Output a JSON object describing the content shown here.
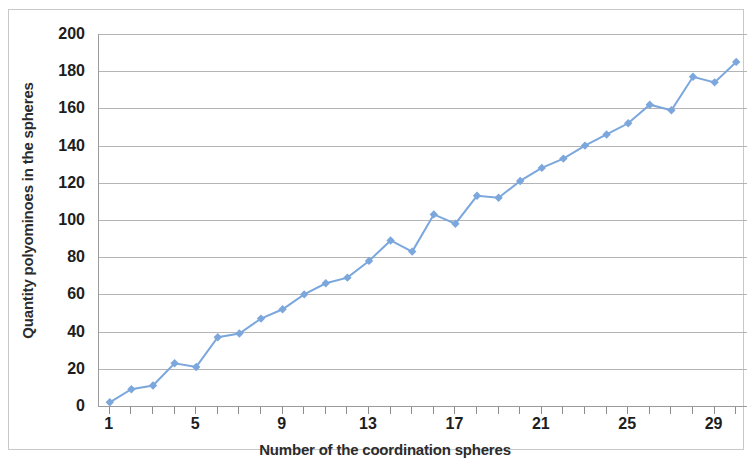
{
  "chart_data": {
    "type": "line",
    "title": "",
    "subtitle": "",
    "xlabel": "Number of the coordination spheres",
    "ylabel": "Quantity polyominoes in the spheres",
    "xlim": [
      0.5,
      30.5
    ],
    "ylim": [
      0,
      200
    ],
    "x_tick_labels": [
      "1",
      "5",
      "9",
      "13",
      "17",
      "21",
      "25",
      "29"
    ],
    "x_tick_values": [
      1,
      5,
      9,
      13,
      17,
      21,
      25,
      29
    ],
    "x_minor_ticks": [
      1,
      2,
      3,
      4,
      5,
      6,
      7,
      8,
      9,
      10,
      11,
      12,
      13,
      14,
      15,
      16,
      17,
      18,
      19,
      20,
      21,
      22,
      23,
      24,
      25,
      26,
      27,
      28,
      29,
      30
    ],
    "y_tick_labels": [
      "0",
      "20",
      "40",
      "60",
      "80",
      "100",
      "120",
      "140",
      "160",
      "180",
      "200"
    ],
    "y_tick_values": [
      0,
      20,
      40,
      60,
      80,
      100,
      120,
      140,
      160,
      180,
      200
    ],
    "grid": true,
    "grid_axis": "y",
    "legend": false,
    "legend_position": "none",
    "marker": "diamond",
    "series_color": "#7ba7dd",
    "grid_color": "#b4b4b4",
    "axis_color": "#9a9a9a",
    "x": [
      1,
      2,
      3,
      4,
      5,
      6,
      7,
      8,
      9,
      10,
      11,
      12,
      13,
      14,
      15,
      16,
      17,
      18,
      19,
      20,
      21,
      22,
      23,
      24,
      25,
      26,
      27,
      28,
      29,
      30
    ],
    "values": [
      2,
      9,
      11,
      23,
      21,
      37,
      39,
      47,
      52,
      60,
      66,
      69,
      78,
      89,
      83,
      103,
      98,
      113,
      112,
      121,
      128,
      133,
      140,
      146,
      152,
      162,
      159,
      177,
      174,
      185
    ],
    "series": [
      {
        "name": "Quantity polyominoes in the spheres",
        "values": [
          2,
          9,
          11,
          23,
          21,
          37,
          39,
          47,
          52,
          60,
          66,
          69,
          78,
          89,
          83,
          103,
          98,
          113,
          112,
          121,
          128,
          133,
          140,
          146,
          152,
          162,
          159,
          177,
          174,
          185
        ]
      }
    ]
  }
}
